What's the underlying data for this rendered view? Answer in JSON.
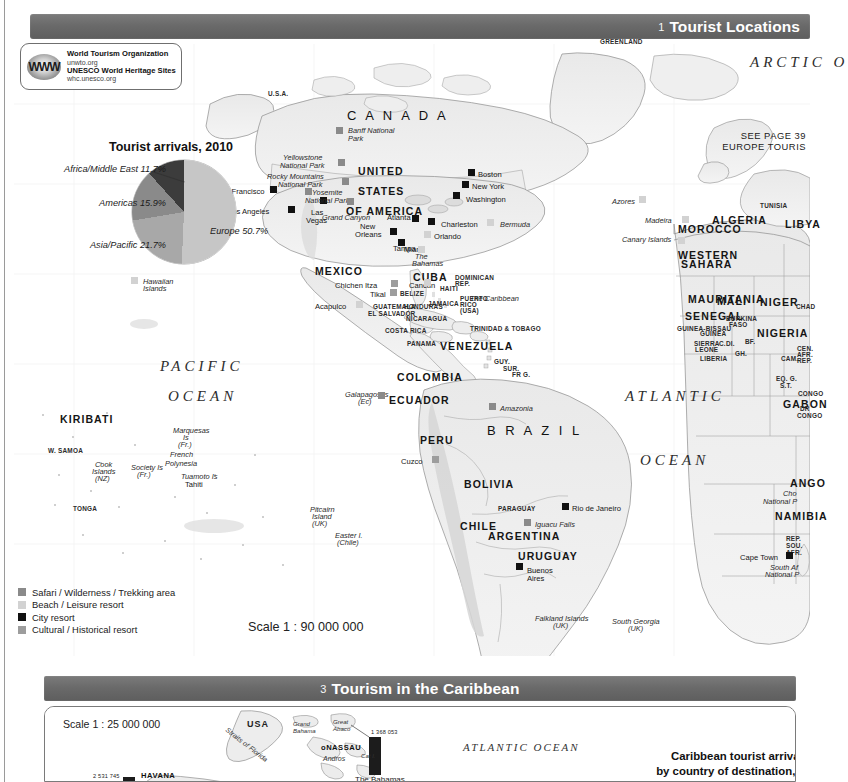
{
  "sections": {
    "tourist": {
      "number": "1",
      "title": "Tourist Locations"
    },
    "caribbean": {
      "number": "3",
      "title": "Tourism in the Caribbean"
    }
  },
  "logo": {
    "mark": "WWW",
    "line1": "World Tourism Organization",
    "line2": "unwto.org",
    "line3": "UNESCO World Heritage Sites",
    "line4": "whc.unesco.org"
  },
  "chart_data": {
    "type": "pie",
    "title": "Tourist arrivals, 2010",
    "categories": [
      "Europe",
      "Asia/Pacific",
      "Americas",
      "Africa/Middle East"
    ],
    "values": [
      50.7,
      21.7,
      15.9,
      11.7
    ],
    "labels": [
      "Europe 50.7%",
      "Asia/Pacific 21.7%",
      "Americas 15.9%",
      "Africa/Middle East 11.7%"
    ],
    "colors": [
      "#c6c6c6",
      "#a8a8a8",
      "#8a8a8a",
      "#3c3c3c"
    ],
    "legend_position": "around-slices",
    "xlabel": "",
    "ylabel": ""
  },
  "legend": {
    "items": [
      {
        "label": "Safari / Wilderness / Trekking area",
        "color": "#8a8a8a"
      },
      {
        "label": "Beach / Leisure resort",
        "color": "#d2d2d2"
      },
      {
        "label": "City resort",
        "color": "#111111"
      },
      {
        "label": "Cultural / Historical resort",
        "color": "#9d9d9d"
      }
    ]
  },
  "scale_main": "Scale 1 : 90 000 000",
  "cross_ref": {
    "line1": "SEE PAGE 39",
    "line2": "EUROPE TOURIS"
  },
  "map": {
    "oceans": [
      {
        "name": "PACIFIC",
        "x": 160,
        "y": 358
      },
      {
        "name": "OCEAN",
        "x": 168,
        "y": 388
      },
      {
        "name": "ATLANTIC",
        "x": 625,
        "y": 388
      },
      {
        "name": "OCEAN",
        "x": 640,
        "y": 452
      },
      {
        "name": "ARCTIC O",
        "x": 750,
        "y": 54
      }
    ],
    "countries_large": [
      {
        "name": "C A N A D A",
        "x": 347,
        "y": 108
      },
      {
        "name": "B R A Z I L",
        "x": 487,
        "y": 423
      }
    ],
    "countries_med": [
      {
        "name": "UNITED",
        "x": 358,
        "y": 165
      },
      {
        "name": "STATES",
        "x": 358,
        "y": 185
      },
      {
        "name": "OF AMERICA",
        "x": 346,
        "y": 205
      },
      {
        "name": "MEXICO",
        "x": 315,
        "y": 265
      },
      {
        "name": "CUBA",
        "x": 413,
        "y": 271
      },
      {
        "name": "VENEZUELA",
        "x": 440,
        "y": 340
      },
      {
        "name": "COLOMBIA",
        "x": 397,
        "y": 371
      },
      {
        "name": "ECUADOR",
        "x": 389,
        "y": 394
      },
      {
        "name": "BOLIVIA",
        "x": 464,
        "y": 478
      },
      {
        "name": "URUGUAY",
        "x": 518,
        "y": 550
      },
      {
        "name": "KIRIBATI",
        "x": 60,
        "y": 413
      },
      {
        "name": "ALGERIA",
        "x": 712,
        "y": 214
      },
      {
        "name": "LIBYA",
        "x": 785,
        "y": 218
      },
      {
        "name": "MALI",
        "x": 717,
        "y": 295
      },
      {
        "name": "NIGER",
        "x": 760,
        "y": 296
      },
      {
        "name": "NIGERIA",
        "x": 757,
        "y": 327
      },
      {
        "name": "MAURITANIA",
        "x": 688,
        "y": 293
      },
      {
        "name": "SENEGAL",
        "x": 685,
        "y": 310
      },
      {
        "name": "MOROCCO",
        "x": 678,
        "y": 223
      },
      {
        "name": "WESTERN",
        "x": 678,
        "y": 249
      },
      {
        "name": "SAHARA",
        "x": 681,
        "y": 258
      },
      {
        "name": "GABON",
        "x": 783,
        "y": 398
      },
      {
        "name": "ANGO",
        "x": 790,
        "y": 477
      },
      {
        "name": "NAMIBIA",
        "x": 775,
        "y": 510
      },
      {
        "name": "PERU",
        "x": 420,
        "y": 434
      },
      {
        "name": "CHILE",
        "x": 460,
        "y": 520
      },
      {
        "name": "ARGENTINA",
        "x": 488,
        "y": 530
      }
    ],
    "countries_small": [
      {
        "name": "GREENLAND",
        "x": 600,
        "y": 38
      },
      {
        "name": "U.S.A.",
        "x": 268,
        "y": 90
      },
      {
        "name": "TUNISIA",
        "x": 760,
        "y": 202
      },
      {
        "name": "BURKINA",
        "x": 726,
        "y": 315
      },
      {
        "name": "FASO",
        "x": 729,
        "y": 321
      },
      {
        "name": "GUINEA-BISSAU",
        "x": 677,
        "y": 325
      },
      {
        "name": "GUINEA",
        "x": 700,
        "y": 330
      },
      {
        "name": "SIERRA",
        "x": 694,
        "y": 340
      },
      {
        "name": "LEONE",
        "x": 695,
        "y": 346
      },
      {
        "name": "LIBERIA",
        "x": 700,
        "y": 355
      },
      {
        "name": "C.DI.",
        "x": 719,
        "y": 340
      },
      {
        "name": "GH.",
        "x": 735,
        "y": 350
      },
      {
        "name": "BF.",
        "x": 745,
        "y": 338
      },
      {
        "name": "CHAD",
        "x": 796,
        "y": 303
      },
      {
        "name": "CAM.",
        "x": 781,
        "y": 355
      },
      {
        "name": "CEN.",
        "x": 797,
        "y": 345
      },
      {
        "name": "AFR.",
        "x": 797,
        "y": 351
      },
      {
        "name": "REP.",
        "x": 797,
        "y": 357
      },
      {
        "name": "EQ. G.",
        "x": 776,
        "y": 375
      },
      {
        "name": "S.T.",
        "x": 780,
        "y": 382
      },
      {
        "name": "CONGO",
        "x": 798,
        "y": 390
      },
      {
        "name": "DR",
        "x": 800,
        "y": 405
      },
      {
        "name": "CONGO",
        "x": 797,
        "y": 412
      },
      {
        "name": "REP.",
        "x": 786,
        "y": 535
      },
      {
        "name": "SOU.",
        "x": 786,
        "y": 542
      },
      {
        "name": "AFR.",
        "x": 786,
        "y": 549
      },
      {
        "name": "BELIZE",
        "x": 400,
        "y": 290
      },
      {
        "name": "HONDURAS",
        "x": 404,
        "y": 303
      },
      {
        "name": "GUATEMALA",
        "x": 373,
        "y": 303
      },
      {
        "name": "EL SALVADOR",
        "x": 368,
        "y": 310
      },
      {
        "name": "NICARAGUA",
        "x": 406,
        "y": 315
      },
      {
        "name": "COSTA RICA",
        "x": 385,
        "y": 327
      },
      {
        "name": "PANAMA",
        "x": 407,
        "y": 340
      },
      {
        "name": "JAMAICA",
        "x": 428,
        "y": 300
      },
      {
        "name": "HAITI",
        "x": 440,
        "y": 285
      },
      {
        "name": "DOMINICAN",
        "x": 455,
        "y": 274
      },
      {
        "name": "REP.",
        "x": 455,
        "y": 280
      },
      {
        "name": "PUERTO",
        "x": 460,
        "y": 295
      },
      {
        "name": "RICO",
        "x": 460,
        "y": 301
      },
      {
        "name": "(USA)",
        "x": 460,
        "y": 307
      },
      {
        "name": "TRINIDAD & TOBAGO",
        "x": 470,
        "y": 325
      },
      {
        "name": "GUY.",
        "x": 494,
        "y": 358
      },
      {
        "name": "SUR.",
        "x": 503,
        "y": 365
      },
      {
        "name": "FR G.",
        "x": 512,
        "y": 371
      },
      {
        "name": "PARAGUAY",
        "x": 498,
        "y": 505
      },
      {
        "name": "W. SAMOA",
        "x": 48,
        "y": 447
      },
      {
        "name": "TONGA",
        "x": 73,
        "y": 505
      }
    ],
    "cities": [
      {
        "name": "San Francisco",
        "x": 216,
        "y": 187,
        "sx": 270,
        "sy": 186,
        "type": "city"
      },
      {
        "name": "Los Angeles",
        "x": 228,
        "y": 207,
        "sx": 288,
        "sy": 206,
        "type": "city"
      },
      {
        "name": "Las",
        "x": 311,
        "y": 208,
        "sx": 320,
        "sy": 197,
        "type": "city"
      },
      {
        "name": "Vegas",
        "x": 306,
        "y": 216,
        "sx": -1,
        "sy": -1,
        "type": "city"
      },
      {
        "name": "Boston",
        "x": 478,
        "y": 170,
        "sx": 468,
        "sy": 169,
        "type": "city"
      },
      {
        "name": "New York",
        "x": 472,
        "y": 182,
        "sx": 462,
        "sy": 181,
        "type": "city"
      },
      {
        "name": "Washington",
        "x": 466,
        "y": 195,
        "sx": 453,
        "sy": 192,
        "type": "city"
      },
      {
        "name": "Atlanta",
        "x": 387,
        "y": 213,
        "sx": 412,
        "sy": 215,
        "type": "city"
      },
      {
        "name": "Charleston",
        "x": 441,
        "y": 220,
        "sx": 428,
        "sy": 218,
        "type": "city"
      },
      {
        "name": "New",
        "x": 360,
        "y": 222,
        "sx": 390,
        "sy": 228,
        "type": "city"
      },
      {
        "name": "Orleans",
        "x": 355,
        "y": 230,
        "sx": -1,
        "sy": -1,
        "type": "city"
      },
      {
        "name": "Miami",
        "x": 404,
        "y": 245,
        "sx": 398,
        "sy": 239,
        "type": "city"
      },
      {
        "name": "Orlando",
        "x": 434,
        "y": 232,
        "sx": 424,
        "sy": 231,
        "type": "beach"
      },
      {
        "name": "Tampa",
        "x": 393,
        "y": 244,
        "sx": 418,
        "sy": 246,
        "type": "beach"
      },
      {
        "name": "Acapulco",
        "x": 315,
        "y": 302,
        "sx": 356,
        "sy": 301,
        "type": "beach"
      },
      {
        "name": "Cancun",
        "x": 409,
        "y": 281,
        "sx": 424,
        "sy": 279,
        "type": "beach"
      },
      {
        "name": "Chichen Itza",
        "x": 335,
        "y": 281,
        "sx": 391,
        "sy": 280,
        "type": "cult"
      },
      {
        "name": "Tikal",
        "x": 370,
        "y": 290,
        "sx": 390,
        "sy": 289,
        "type": "cult"
      },
      {
        "name": "Cuzco",
        "x": 401,
        "y": 457,
        "sx": 432,
        "sy": 456,
        "type": "cult"
      },
      {
        "name": "Rio de Janeiro",
        "x": 572,
        "y": 504,
        "sx": 562,
        "sy": 503,
        "type": "city"
      },
      {
        "name": "Buenos",
        "x": 527,
        "y": 566,
        "sx": 516,
        "sy": 563,
        "type": "city"
      },
      {
        "name": "Aires",
        "x": 527,
        "y": 574,
        "sx": -1,
        "sy": -1,
        "type": "city"
      },
      {
        "name": "Cape Town",
        "x": 740,
        "y": 553,
        "sx": 786,
        "sy": 552,
        "type": "city"
      },
      {
        "name": "Tahiti",
        "x": 185,
        "y": 480,
        "sx": -1,
        "sy": -1,
        "type": "beach"
      }
    ],
    "sites": [
      {
        "name": "Banff National",
        "x": 348,
        "y": 126,
        "sx": 336,
        "sy": 127,
        "type": "safari"
      },
      {
        "name": "Park",
        "x": 348,
        "y": 134,
        "sx": -1,
        "sy": -1,
        "type": "safari"
      },
      {
        "name": "Yellowstone",
        "x": 283,
        "y": 153,
        "sx": 338,
        "sy": 159,
        "type": "safari"
      },
      {
        "name": "National Park",
        "x": 280,
        "y": 161,
        "sx": -1,
        "sy": -1,
        "type": "safari"
      },
      {
        "name": "Rocky Mountains",
        "x": 267,
        "y": 172,
        "sx": 342,
        "sy": 178,
        "type": "safari"
      },
      {
        "name": "National Park",
        "x": 278,
        "y": 180,
        "sx": -1,
        "sy": -1,
        "type": "safari"
      },
      {
        "name": "Yosemite",
        "x": 312,
        "y": 188,
        "sx": 305,
        "sy": 188,
        "type": "safari"
      },
      {
        "name": "National Park",
        "x": 305,
        "y": 196,
        "sx": -1,
        "sy": -1,
        "type": "safari"
      },
      {
        "name": "Grand Canyon",
        "x": 322,
        "y": 213,
        "sx": 347,
        "sy": 198,
        "type": "safari"
      },
      {
        "name": "Bermuda",
        "x": 500,
        "y": 220,
        "sx": 487,
        "sy": 219,
        "type": "beach"
      },
      {
        "name": "The",
        "x": 415,
        "y": 252,
        "sx": -1,
        "sy": -1,
        "type": "beach"
      },
      {
        "name": "Bahamas",
        "x": 412,
        "y": 259,
        "sx": -1,
        "sy": -1,
        "type": "beach"
      },
      {
        "name": "The Caribbean",
        "x": 470,
        "y": 294,
        "sx": -1,
        "sy": -1,
        "type": "beach"
      },
      {
        "name": "Amazonia",
        "x": 500,
        "y": 404,
        "sx": 489,
        "sy": 403,
        "type": "safari"
      },
      {
        "name": "Iguacu Falls",
        "x": 535,
        "y": 520,
        "sx": 524,
        "sy": 519,
        "type": "safari"
      },
      {
        "name": "Galapagos Is",
        "x": 345,
        "y": 390,
        "sx": 378,
        "sy": 392,
        "type": "safari"
      },
      {
        "name": "(Ec)",
        "x": 358,
        "y": 397,
        "sx": -1,
        "sy": -1,
        "type": "safari"
      },
      {
        "name": "Hawaiian",
        "x": 143,
        "y": 277,
        "sx": 131,
        "sy": 277,
        "type": "beach"
      },
      {
        "name": "Islands",
        "x": 143,
        "y": 284,
        "sx": -1,
        "sy": -1,
        "type": "beach"
      },
      {
        "name": "Azores",
        "x": 612,
        "y": 197,
        "sx": 639,
        "sy": 196,
        "type": "beach"
      },
      {
        "name": "Madeira",
        "x": 645,
        "y": 216,
        "sx": 682,
        "sy": 216,
        "type": "beach"
      },
      {
        "name": "Canary Islands",
        "x": 622,
        "y": 235,
        "sx": 678,
        "sy": 237,
        "type": "beach"
      },
      {
        "name": "Cho",
        "x": 783,
        "y": 489,
        "sx": -1,
        "sy": -1,
        "type": "safari"
      },
      {
        "name": "National P",
        "x": 763,
        "y": 497,
        "sx": -1,
        "sy": -1,
        "type": "safari"
      },
      {
        "name": "South Af",
        "x": 770,
        "y": 563,
        "sx": -1,
        "sy": -1,
        "type": "safari"
      },
      {
        "name": "National P",
        "x": 765,
        "y": 570,
        "sx": -1,
        "sy": -1,
        "type": "safari"
      },
      {
        "name": "Marquesas",
        "x": 173,
        "y": 426,
        "sx": -1,
        "sy": -1,
        "type": "beach"
      },
      {
        "name": "Is",
        "x": 183,
        "y": 433,
        "sx": -1,
        "sy": -1,
        "type": "beach"
      },
      {
        "name": "(Fr.)",
        "x": 178,
        "y": 440,
        "sx": -1,
        "sy": -1,
        "type": "beach"
      },
      {
        "name": "French",
        "x": 170,
        "y": 450,
        "sx": -1,
        "sy": -1,
        "type": "beach"
      },
      {
        "name": "Polynesia",
        "x": 165,
        "y": 459,
        "sx": -1,
        "sy": -1,
        "type": "beach"
      },
      {
        "name": "Society Is",
        "x": 131,
        "y": 463,
        "sx": -1,
        "sy": -1,
        "type": "beach"
      },
      {
        "name": "(Fr.)",
        "x": 137,
        "y": 470,
        "sx": -1,
        "sy": -1,
        "type": "beach"
      },
      {
        "name": "Tuamoto Is",
        "x": 181,
        "y": 472,
        "sx": -1,
        "sy": -1,
        "type": "beach"
      },
      {
        "name": "Cook",
        "x": 95,
        "y": 460,
        "sx": -1,
        "sy": -1,
        "type": "beach"
      },
      {
        "name": "Islands",
        "x": 92,
        "y": 467,
        "sx": -1,
        "sy": -1,
        "type": "beach"
      },
      {
        "name": "(NZ)",
        "x": 95,
        "y": 474,
        "sx": -1,
        "sy": -1,
        "type": "beach"
      },
      {
        "name": "Pitcairn",
        "x": 310,
        "y": 505,
        "sx": -1,
        "sy": -1,
        "type": "beach"
      },
      {
        "name": "Island",
        "x": 312,
        "y": 512,
        "sx": -1,
        "sy": -1,
        "type": "beach"
      },
      {
        "name": "(UK)",
        "x": 312,
        "y": 519,
        "sx": -1,
        "sy": -1,
        "type": "beach"
      },
      {
        "name": "Easter I.",
        "x": 335,
        "y": 531,
        "sx": -1,
        "sy": -1,
        "type": "beach"
      },
      {
        "name": "(Chile)",
        "x": 337,
        "y": 538,
        "sx": -1,
        "sy": -1,
        "type": "beach"
      },
      {
        "name": "Falkland Islands",
        "x": 535,
        "y": 614,
        "sx": -1,
        "sy": -1,
        "type": "beach"
      },
      {
        "name": "(UK)",
        "x": 553,
        "y": 621,
        "sx": -1,
        "sy": -1,
        "type": "beach"
      },
      {
        "name": "South Georgia",
        "x": 612,
        "y": 617,
        "sx": -1,
        "sy": -1,
        "type": "beach"
      },
      {
        "name": "(UK)",
        "x": 628,
        "y": 624,
        "sx": -1,
        "sy": -1,
        "type": "beach"
      }
    ]
  },
  "caribbean": {
    "scale": "Scale 1 : 25 000 000",
    "title_line1": "Caribbean tourist arrivals",
    "title_line2": "by country of destination, 2010",
    "ocean": "ATLANTIC OCEAN",
    "bars": [
      {
        "country": "The Bahamas",
        "value": "1 368 053",
        "height": 38
      },
      {
        "country": "HAVANA",
        "value": "2 531 745",
        "height": 52
      }
    ],
    "places": [
      {
        "name": "USA",
        "type": "country"
      },
      {
        "name": "Grand",
        "type": "island"
      },
      {
        "name": "Bahama",
        "type": "island"
      },
      {
        "name": "Great",
        "type": "island"
      },
      {
        "name": "Abaco",
        "type": "island"
      },
      {
        "name": "NASSAU",
        "type": "city"
      },
      {
        "name": "Andros",
        "type": "island"
      },
      {
        "name": "Cat I.",
        "type": "island"
      },
      {
        "name": "Straits of Florida",
        "type": "water"
      },
      {
        "name": "HAVANA",
        "type": "city"
      }
    ]
  }
}
